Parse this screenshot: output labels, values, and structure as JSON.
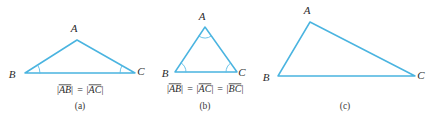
{
  "figure": {
    "background_color": "#ffffff",
    "line_color": "#4ab4e0",
    "arc_color": "#5bbde6",
    "text_color": "#2b2b2b",
    "width": 432,
    "height": 124
  },
  "panels": [
    {
      "id": "a",
      "caption": "(a)",
      "type": "isosceles-triangle",
      "vertices": {
        "A": {
          "label": "A",
          "x": 77,
          "y": 40
        },
        "B": {
          "label": "B",
          "x": 25,
          "y": 73
        },
        "C": {
          "label": "C",
          "x": 135,
          "y": 73
        }
      },
      "vertex_label_positions": {
        "A": {
          "x": 74,
          "y": 32
        },
        "B": {
          "x": 12,
          "y": 78
        },
        "C": {
          "x": 141,
          "y": 75
        }
      },
      "marked_angles": [
        "B",
        "C"
      ],
      "equation": {
        "terms": [
          "AB",
          "AC"
        ],
        "operators": [
          "="
        ],
        "text": "|AB| = |AC|"
      },
      "equation_position": {
        "x": 80,
        "y": 93
      },
      "caption_position": {
        "x": 80,
        "y": 109
      }
    },
    {
      "id": "b",
      "caption": "(b)",
      "type": "equilateral-triangle",
      "vertices": {
        "A": {
          "label": "A",
          "x": 205,
          "y": 27
        },
        "B": {
          "label": "B",
          "x": 175,
          "y": 72
        },
        "C": {
          "label": "C",
          "x": 237,
          "y": 72
        }
      },
      "vertex_label_positions": {
        "A": {
          "x": 202,
          "y": 20
        },
        "B": {
          "x": 165,
          "y": 77
        },
        "C": {
          "x": 242,
          "y": 76
        }
      },
      "marked_angles": [
        "A",
        "B",
        "C"
      ],
      "equation": {
        "terms": [
          "AB",
          "AC",
          "BC"
        ],
        "operators": [
          "=",
          "="
        ],
        "text": "|AB| = |AC| = |BC|"
      },
      "equation_position": {
        "x": 205,
        "y": 92
      },
      "caption_position": {
        "x": 205,
        "y": 109
      }
    },
    {
      "id": "c",
      "caption": "(c)",
      "type": "scalene-triangle",
      "vertices": {
        "A": {
          "label": "A",
          "x": 310,
          "y": 22
        },
        "B": {
          "label": "B",
          "x": 278,
          "y": 76
        },
        "C": {
          "label": "C",
          "x": 415,
          "y": 76
        }
      },
      "vertex_label_positions": {
        "A": {
          "x": 307,
          "y": 14
        },
        "B": {
          "x": 266,
          "y": 81
        },
        "C": {
          "x": 421,
          "y": 79
        }
      },
      "marked_angles": [],
      "equation": null,
      "equation_position": null,
      "caption_position": {
        "x": 345,
        "y": 109
      }
    }
  ]
}
